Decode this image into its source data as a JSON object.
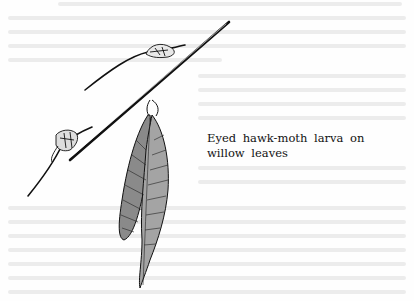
{
  "page": {
    "background": "#fefefe",
    "ink_color": "#111111",
    "bleed_through_color": "#ececec"
  },
  "figure": {
    "caption": "Eyed hawk-moth larva on willow leaves"
  }
}
